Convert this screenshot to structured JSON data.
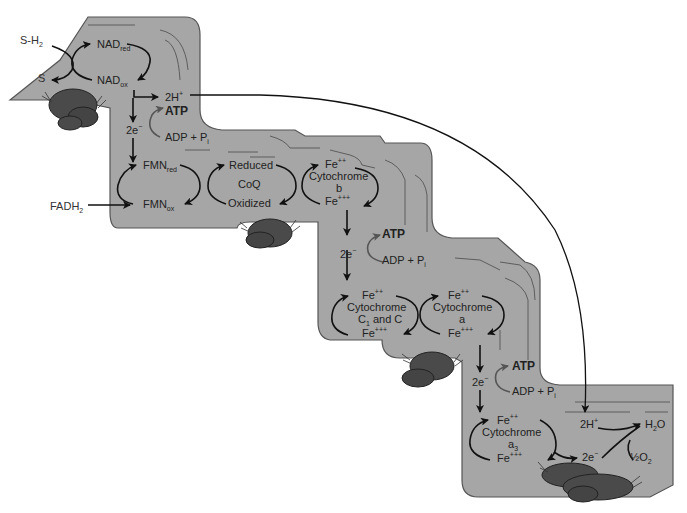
{
  "colors": {
    "step_fill": "#a6a6a6",
    "step_stroke": "#555555",
    "rock_fill": "#4a4a4a",
    "line": "#111111",
    "background": "#ffffff"
  },
  "outside_labels": {
    "sh2": "S-H",
    "sh2_sub": "2",
    "s": "S",
    "fadh2": "FADH",
    "fadh2_sub": "2"
  },
  "step1": {
    "nad_red": "NAD",
    "nad_red_sub": "red",
    "nad_ox": "NAD",
    "nad_ox_sub": "ox",
    "two_h_plus": "2H",
    "two_h_plus_sup": "+",
    "atp": "ATP",
    "adp_pi": "ADP + P",
    "adp_pi_sub": "i",
    "two_e": "2e",
    "two_e_sup": "−"
  },
  "step2": {
    "fmn_red": "FMN",
    "fmn_red_sub": "red",
    "fmn_ox": "FMN",
    "fmn_ox_sub": "ox",
    "coq_reduced": "Reduced",
    "coq_name": "CoQ",
    "coq_oxidized": "Oxidized",
    "cytb_fe2": "Fe",
    "cytb_fe2_sup": "++",
    "cytb_name": "Cytochrome",
    "cytb_letter": "b",
    "cytb_fe3": "Fe",
    "cytb_fe3_sup": "+++"
  },
  "step3": {
    "two_e": "2e",
    "two_e_sup": "−",
    "atp": "ATP",
    "adp_pi": "ADP + P",
    "adp_pi_sub": "i",
    "cytc_fe2": "Fe",
    "cytc_fe2_sup": "++",
    "cytc_name": "Cytochrome",
    "cytc_letters": "C",
    "cytc_letters_sub": "1",
    "cytc_letters_rest": " and C",
    "cytc_fe3": "Fe",
    "cytc_fe3_sup": "+++",
    "cyta_fe2": "Fe",
    "cyta_fe2_sup": "++",
    "cyta_name": "Cytochrome",
    "cyta_letter": "a",
    "cyta_fe3": "Fe",
    "cyta_fe3_sup": "+++"
  },
  "step4": {
    "two_e": "2e",
    "two_e_sup": "−",
    "atp": "ATP",
    "adp_pi": "ADP + P",
    "adp_pi_sub": "i",
    "cyta3_fe2": "Fe",
    "cyta3_fe2_sup": "++",
    "cyta3_name": "Cytochrome",
    "cyta3_letter": "a",
    "cyta3_letter_sub": "3",
    "cyta3_fe3": "Fe",
    "cyta3_fe3_sup": "+++",
    "two_h_plus": "2H",
    "two_h_plus_sup": "+",
    "two_e_final": "2e",
    "two_e_final_sup": "−",
    "water": "H",
    "water_sub": "2",
    "water_rest": "O",
    "half": "½",
    "oxygen": "O",
    "oxygen_sub": "2"
  }
}
